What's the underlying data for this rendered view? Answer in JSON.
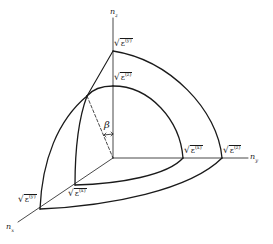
{
  "figure": {
    "type": "index-ellipsoid-octant",
    "line_color": "#1a1a1a",
    "background": "#ffffff"
  },
  "axes": {
    "vertical": {
      "base": "n",
      "sub": "z"
    },
    "right": {
      "base": "n",
      "sub": "y"
    },
    "diagonal": {
      "base": "n",
      "sub": "x"
    }
  },
  "labels": {
    "top_outer": {
      "radical": "√",
      "base": "ε",
      "sup": "(y)"
    },
    "top_inner": {
      "radical": "√",
      "base": "ε",
      "sup": "(z)"
    },
    "right_inner": {
      "radical": "√",
      "base": "ε",
      "sup": "(x)"
    },
    "right_outer": {
      "radical": "√",
      "base": "ε",
      "sup": "(z)"
    },
    "front_inner": {
      "radical": "√",
      "base": "ε",
      "sup": "(x)"
    },
    "front_outer": {
      "radical": "√",
      "base": "ε",
      "sup": "(y)"
    }
  },
  "angle": {
    "symbol": "β"
  }
}
